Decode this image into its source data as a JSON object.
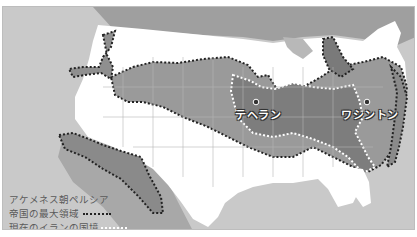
{
  "map": {
    "basemap": "United States (overlay comparison)",
    "colors": {
      "ocean": "#c9c9c9",
      "land_outside": "#ffffff",
      "empire_fill": "#9a9a9a",
      "iran_fill": "#7d7d7d",
      "empire_border": "#222222",
      "iran_border": "#ffffff",
      "canada": "#9f9f9f",
      "mexico": "#a8a8a8",
      "lakes": "#b8b8b8"
    },
    "cities": [
      {
        "name": "テヘラン",
        "marker": "dot"
      },
      {
        "name": "ワシントン",
        "marker": "dot"
      }
    ]
  },
  "legend": {
    "items": [
      {
        "label_line1": "アケメネス朝ペルシア",
        "label_line2": "帝国の最大領域",
        "style": "black-dotted-line"
      },
      {
        "label": "現在のイランの国境",
        "style": "white-dotted-line"
      }
    ]
  }
}
